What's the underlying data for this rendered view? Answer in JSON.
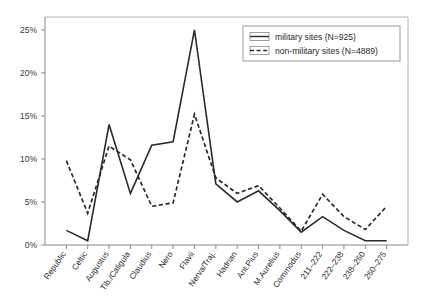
{
  "chart_data": {
    "type": "line",
    "title": "",
    "subtitle": "",
    "xlabel": "",
    "ylabel": "",
    "ylim": [
      0,
      26.5
    ],
    "ytick_values": [
      0,
      5,
      10,
      15,
      20,
      25
    ],
    "ytick_labels": [
      "0%",
      "5%",
      "10%",
      "15%",
      "20%",
      "25%"
    ],
    "grid": false,
    "legend_position": "top-right",
    "categories": [
      "Republic",
      "Celtic",
      "Augustus",
      "Tib./Caligula",
      "Claudius",
      "Nero",
      "Flavii",
      "Nerva/Traj.",
      "Hadrian",
      "Ant.Pius",
      "M.Aurelius",
      "Commodus",
      "211–222",
      "222–238",
      "238–260",
      "260–275"
    ],
    "series": [
      {
        "name": "military sites (N=925)",
        "style": "solid",
        "n": 925,
        "values": [
          1.7,
          0.5,
          14.0,
          6.0,
          11.6,
          12.0,
          25.0,
          7.1,
          5.0,
          6.3,
          4.0,
          1.5,
          3.3,
          1.7,
          0.5,
          0.5
        ]
      },
      {
        "name": "non-military sites (N=4889)",
        "style": "dashed",
        "n": 4889,
        "values": [
          9.8,
          3.7,
          11.5,
          9.9,
          4.5,
          4.9,
          15.2,
          7.8,
          6.0,
          6.9,
          4.3,
          1.6,
          5.9,
          3.3,
          1.8,
          4.5
        ]
      }
    ],
    "legend_entries": [
      "military sites (N=925)",
      "non-military sites (N=4889)"
    ],
    "colors": {
      "series_line": "#2b2b2b",
      "axis": "#8a8a8a",
      "frame": "#b4b4b4",
      "background": "#ffffff"
    }
  }
}
